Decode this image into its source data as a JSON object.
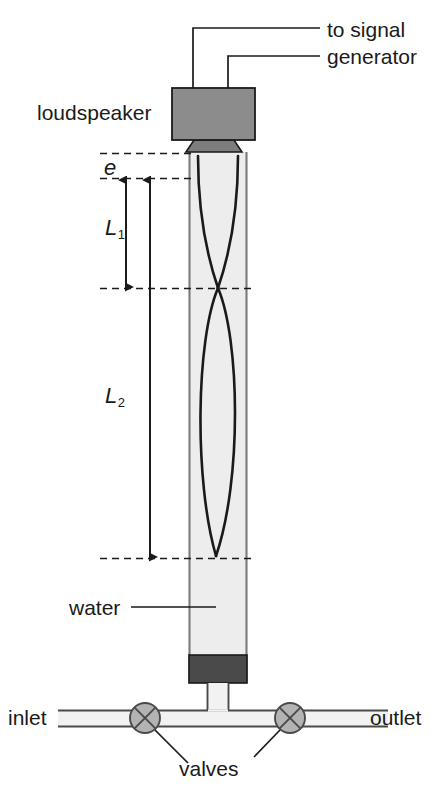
{
  "figure": {
    "width": 444,
    "height": 795
  },
  "labels": {
    "to_signal": "to signal",
    "generator": "generator",
    "loudspeaker": "loudspeaker",
    "end_correction": "e",
    "length_1": "L",
    "length_1_sub": "1",
    "length_2": "L",
    "length_2_sub": "2",
    "water": "water",
    "inlet": "inlet",
    "outlet": "outlet",
    "valves": "valves"
  },
  "colors": {
    "speaker_fill": "#8c8c8c",
    "cone_fill": "#7d7d7d",
    "tube_water_fill": "#ededed",
    "tube_wall": "#7a7a7a",
    "cap_fill": "#4a4a4a",
    "valve_fill": "#b3b3b3",
    "pipe_fill": "#f2f2f2",
    "line": "#1a1a1a",
    "dash": "#1a1a1a",
    "background": "#ffffff"
  },
  "geometry": {
    "speaker_box": {
      "x": 172,
      "y": 88,
      "w": 83,
      "h": 52
    },
    "cone": {
      "top_y": 140,
      "bottom_y": 153
    },
    "tube": {
      "left_x": 189,
      "right_x": 247,
      "top_y": 152,
      "bottom_y": 683
    },
    "cap": {
      "x": 189,
      "y": 655,
      "w": 58,
      "h": 28
    },
    "dashed_lines_y": [
      153,
      178,
      288,
      558
    ],
    "valve_left": {
      "cx": 145,
      "cy": 718,
      "r": 15
    },
    "valve_right": {
      "cx": 290,
      "cy": 718,
      "r": 15
    },
    "pipe_y": [
      710,
      726
    ],
    "lead_wire_x": [
      193,
      228
    ]
  },
  "measurements": [
    {
      "name": "e",
      "description": "end correction",
      "from_y": 153,
      "to_y": 178,
      "arrow_x": 126
    },
    {
      "name": "L1",
      "description": "first resonance length",
      "from_y": 178,
      "to_y": 288,
      "arrow_x": 126
    },
    {
      "name": "L2",
      "description": "second resonance length",
      "from_y": 178,
      "to_y": 558,
      "arrow_x": 150
    }
  ],
  "standing_wave": {
    "nodes_y": [
      288,
      558
    ],
    "antinodes_y": [
      178,
      423
    ],
    "amplitude_px": 26
  }
}
